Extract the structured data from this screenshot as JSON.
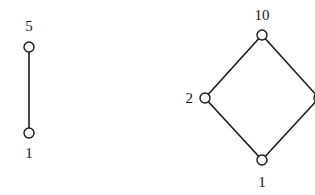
{
  "diagrams": [
    {
      "name": "chain",
      "nodes": [
        {
          "id": "top",
          "label": "5",
          "x": 29,
          "y": 47,
          "label_x": 29,
          "label_y": 31,
          "anchor": "middle"
        },
        {
          "id": "bottom",
          "label": "1",
          "x": 29,
          "y": 133,
          "label_x": 29,
          "label_y": 158,
          "anchor": "middle"
        }
      ],
      "edges": [
        [
          "top",
          "bottom"
        ]
      ]
    },
    {
      "name": "diamond",
      "nodes": [
        {
          "id": "top",
          "label": "10",
          "x": 262,
          "y": 35,
          "label_x": 262,
          "label_y": 20,
          "anchor": "middle"
        },
        {
          "id": "left",
          "label": "2",
          "x": 205,
          "y": 98,
          "label_x": 193,
          "label_y": 103,
          "anchor": "end"
        },
        {
          "id": "bottom",
          "label": "1",
          "x": 262,
          "y": 160,
          "label_x": 262,
          "label_y": 187,
          "anchor": "middle"
        },
        {
          "id": "right",
          "label": "",
          "x": 319,
          "y": 98,
          "label_x": 330,
          "label_y": 103,
          "anchor": "start"
        }
      ],
      "edges": [
        [
          "top",
          "left"
        ],
        [
          "top",
          "right"
        ],
        [
          "left",
          "bottom"
        ],
        [
          "right",
          "bottom"
        ]
      ]
    }
  ],
  "style": {
    "stroke": "#1a1a1a",
    "node_radius": 5
  }
}
